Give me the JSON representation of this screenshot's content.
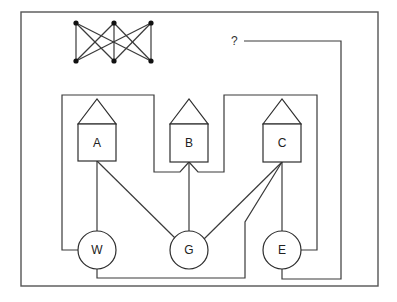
{
  "diagram": {
    "type": "utilities-puzzle",
    "question_mark": "?",
    "houses": [
      {
        "id": "A",
        "label": "A"
      },
      {
        "id": "B",
        "label": "B"
      },
      {
        "id": "C",
        "label": "C"
      }
    ],
    "utilities": [
      {
        "id": "W",
        "label": "W"
      },
      {
        "id": "G",
        "label": "G"
      },
      {
        "id": "E",
        "label": "E"
      }
    ],
    "inset_graph": {
      "name": "K3,3",
      "top_nodes": 3,
      "bottom_nodes": 3
    },
    "connections": [
      {
        "from": "A",
        "to": "W"
      },
      {
        "from": "A",
        "to": "G"
      },
      {
        "from": "A",
        "to": "E"
      },
      {
        "from": "B",
        "to": "G"
      },
      {
        "from": "B",
        "to": "W"
      },
      {
        "from": "B",
        "to": "E"
      },
      {
        "from": "C",
        "to": "E"
      },
      {
        "from": "C",
        "to": "G"
      },
      {
        "from": "C",
        "to": "W"
      },
      {
        "from": "?",
        "to": "E"
      }
    ],
    "colors": {
      "line": "#3a3a3a",
      "border": "#555555",
      "background": "#ffffff"
    }
  }
}
